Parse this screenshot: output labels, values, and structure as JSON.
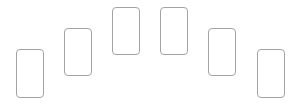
{
  "diagram": {
    "type": "card-arc",
    "border_color": "#a3a3a3",
    "background": "#ffffff",
    "cards": [
      {
        "x": 16,
        "y": 49,
        "w": 28,
        "h": 49
      },
      {
        "x": 64,
        "y": 28,
        "w": 28,
        "h": 48
      },
      {
        "x": 112,
        "y": 7,
        "w": 28,
        "h": 48
      },
      {
        "x": 160,
        "y": 7,
        "w": 28,
        "h": 48
      },
      {
        "x": 208,
        "y": 28,
        "w": 28,
        "h": 48
      },
      {
        "x": 257,
        "y": 49,
        "w": 28,
        "h": 49
      }
    ]
  }
}
